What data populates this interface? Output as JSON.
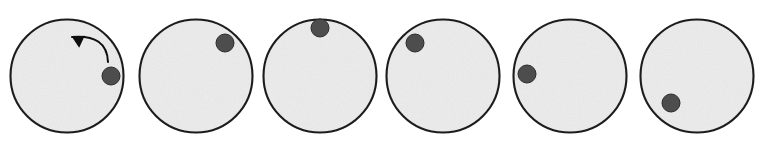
{
  "figure": {
    "name": "ball-rolling-inside-circle-sequence",
    "description": "Six-panel sequence of a ball rolling counterclockwise along the inside wall of a circular track",
    "panel_count": 6,
    "canvas": {
      "width": 772,
      "height": 149
    },
    "colors": {
      "background": "#ffffff",
      "circle_fill": "#ececec",
      "circle_stroke": "#1c1c1c",
      "ball_fill": "#4e4e4e",
      "ball_stroke": "#2a2a2a",
      "arrow": "#111111"
    },
    "circle": {
      "radius": 56.5,
      "stroke_width": 2.1,
      "center_y": 76
    },
    "ball": {
      "radius": 9.0,
      "stroke_width": 1.0
    },
    "panels": [
      {
        "index": 1,
        "label": "panel-1",
        "circle_center": {
          "x": 67,
          "y": 76
        },
        "ball_center": {
          "x": 111,
          "y": 76
        },
        "ball_angle_deg": 0,
        "has_direction_arrow": true,
        "arrow": {
          "name": "counterclockwise-arrow",
          "start": {
            "x": 108,
            "y": 62
          },
          "end": {
            "x": 72,
            "y": 37
          },
          "control": {
            "x": 107,
            "y": 34
          },
          "head_angle_deg": 205
        }
      },
      {
        "index": 2,
        "label": "panel-2",
        "circle_center": {
          "x": 196,
          "y": 76
        },
        "ball_center": {
          "x": 225,
          "y": 43
        },
        "ball_angle_deg": 49,
        "has_direction_arrow": false,
        "arrow": null
      },
      {
        "index": 3,
        "label": "panel-3",
        "circle_center": {
          "x": 320,
          "y": 76
        },
        "ball_center": {
          "x": 320,
          "y": 28
        },
        "ball_angle_deg": 90,
        "has_direction_arrow": false,
        "arrow": null
      },
      {
        "index": 4,
        "label": "panel-4",
        "circle_center": {
          "x": 443,
          "y": 76
        },
        "ball_center": {
          "x": 415,
          "y": 43
        },
        "ball_angle_deg": 130,
        "has_direction_arrow": false,
        "arrow": null
      },
      {
        "index": 5,
        "label": "panel-5",
        "circle_center": {
          "x": 570,
          "y": 76
        },
        "ball_center": {
          "x": 527,
          "y": 74
        },
        "ball_angle_deg": 177,
        "has_direction_arrow": false,
        "arrow": null
      },
      {
        "index": 6,
        "label": "panel-6",
        "circle_center": {
          "x": 697,
          "y": 76
        },
        "ball_center": {
          "x": 671,
          "y": 103
        },
        "ball_angle_deg": 226,
        "has_direction_arrow": false,
        "arrow": null
      }
    ]
  }
}
